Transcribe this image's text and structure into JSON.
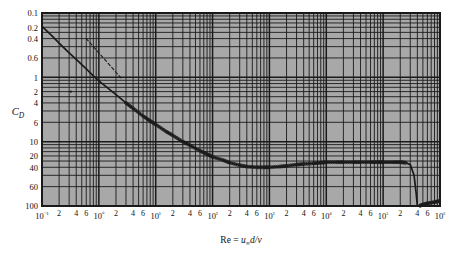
{
  "figure": {
    "title": "",
    "background_color": "#ffffff",
    "plot_background_color": "#a8a8a8",
    "grid_color": "#1a1a1a",
    "curve_color": "#1a1a1a"
  },
  "axes": {
    "y_axis_label": "C",
    "y_axis_label_sub": "D",
    "x_axis_label_prefix": "Re = ",
    "x_axis_label_u": "u",
    "x_axis_label_inf": "∞",
    "x_axis_label_d": "d/",
    "x_axis_label_nu": "ν",
    "x_axis_label_full": "Re = u∞d/ν",
    "y_tick_labels": [
      "100",
      "60",
      "40",
      "20",
      "10",
      "6",
      "4",
      "2",
      "1",
      "0.6",
      "0.4",
      "0.2",
      "0.1"
    ],
    "x_decade_labels": [
      "10⁻¹",
      "10⁰",
      "10¹",
      "10²",
      "10³",
      "10⁴",
      "10⁵",
      "10⁶"
    ],
    "x_minor_labels": [
      "2",
      "4",
      "6"
    ]
  },
  "chart_data": {
    "type": "line",
    "title": "",
    "subtitle": "",
    "xlabel": "Re = u∞d/ν",
    "ylabel": "C_D",
    "xscale": "log",
    "yscale": "log",
    "xlim": [
      0.1,
      1000000
    ],
    "ylim": [
      0.1,
      100
    ],
    "grid": true,
    "legend": "none",
    "y_ticks": [
      0.1,
      0.2,
      0.4,
      0.6,
      1,
      2,
      4,
      6,
      10,
      20,
      40,
      60,
      100
    ],
    "x_ticks": [
      0.1,
      0.2,
      0.4,
      0.6,
      1,
      2,
      4,
      6,
      10,
      20,
      40,
      60,
      100,
      200,
      400,
      600,
      1000,
      2000,
      4000,
      6000,
      10000,
      20000,
      40000,
      60000,
      100000,
      200000,
      400000,
      600000,
      1000000
    ],
    "series": [
      {
        "name": "sphere-drag-curve",
        "style": "solid",
        "marker": "circle-open",
        "x": [
          0.1,
          0.15,
          0.2,
          0.3,
          0.4,
          0.6,
          0.8,
          1.0,
          1.5,
          2.0,
          3.0,
          4.0,
          6.0,
          8.0,
          10,
          15,
          20,
          30,
          40,
          60,
          80,
          100,
          150,
          200,
          300,
          400,
          600,
          800,
          1000,
          1500,
          2000,
          3000,
          4000,
          6000,
          8000,
          10000,
          15000,
          20000,
          30000,
          40000,
          60000,
          80000,
          100000,
          150000,
          200000,
          250000,
          300000,
          350000,
          380000,
          400000,
          430000,
          500000,
          600000,
          800000,
          1000000
        ],
        "y": [
          62,
          44,
          34,
          24,
          19,
          13.5,
          10.5,
          8.8,
          6.6,
          5.4,
          4.0,
          3.3,
          2.5,
          2.1,
          1.85,
          1.45,
          1.25,
          1.0,
          0.88,
          0.72,
          0.64,
          0.58,
          0.52,
          0.47,
          0.43,
          0.41,
          0.4,
          0.4,
          0.4,
          0.41,
          0.42,
          0.44,
          0.45,
          0.46,
          0.47,
          0.48,
          0.48,
          0.48,
          0.48,
          0.48,
          0.48,
          0.48,
          0.48,
          0.48,
          0.48,
          0.47,
          0.44,
          0.3,
          0.16,
          0.1,
          0.1,
          0.105,
          0.11,
          0.115,
          0.12
        ]
      },
      {
        "name": "stokes-law-asymptote",
        "style": "dashed",
        "marker": "none",
        "x": [
          0.6,
          1.0,
          1.5,
          2.0,
          2.5
        ],
        "y": [
          40,
          24,
          16,
          12,
          9.6
        ]
      }
    ],
    "annotations": [
      {
        "name": "stray-mark",
        "x": 0.32,
        "y": 6.0,
        "text": ""
      }
    ]
  }
}
